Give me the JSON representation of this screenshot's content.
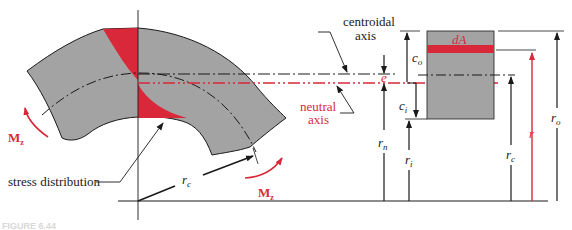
{
  "figure": {
    "caption_fragment": "FIGURE 6.44",
    "colors": {
      "body_gray": "#a3a3a3",
      "stress_red": "#d8283a",
      "line_black": "#1a1a1a",
      "background": "#ffffff"
    }
  },
  "labels": {
    "centroidal_axis_line1": "centroidal",
    "centroidal_axis_line2": "axis",
    "neutral_axis_line1": "neutral",
    "neutral_axis_line2": "axis",
    "stress_distribution": "stress distribution",
    "moment_left": "M",
    "moment_left_sub": "z",
    "moment_right": "M",
    "moment_right_sub": "z",
    "radius_centroid_main": "r",
    "radius_centroid_main_sub": "c",
    "eccentricity": "e",
    "c_outer": "c",
    "c_outer_sub": "o",
    "c_inner": "c",
    "c_inner_sub": "i",
    "r_neutral": "r",
    "r_neutral_sub": "n",
    "r_inner": "r",
    "r_inner_sub": "i",
    "r_centroid": "r",
    "r_centroid_sub": "c",
    "r_general": "r",
    "r_outer": "r",
    "r_outer_sub": "o",
    "area_element": "dA"
  }
}
